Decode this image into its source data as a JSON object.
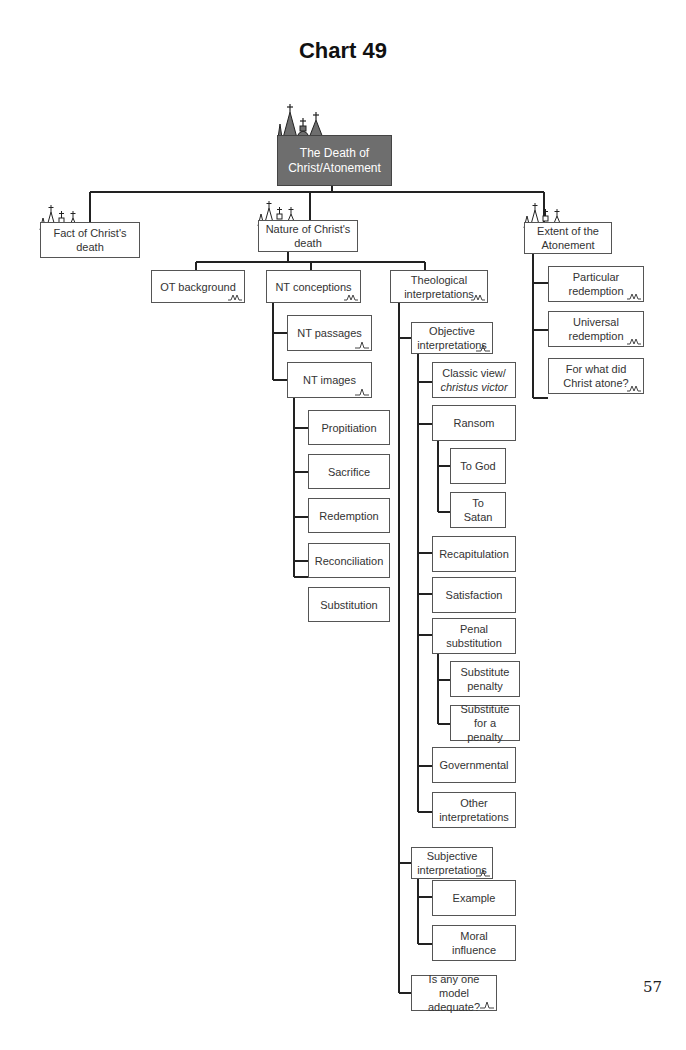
{
  "title": "Chart 49",
  "page_number": "57",
  "root": {
    "label": "The Death of Christ/Atonement",
    "icon": "church-skyline-icon"
  },
  "level1": [
    {
      "id": "fact",
      "label": "Fact of Christ's death"
    },
    {
      "id": "nature",
      "label": "Nature of Christ's death"
    },
    {
      "id": "extent",
      "label": "Extent of the Atonement"
    }
  ],
  "nature": {
    "children": [
      {
        "label": "OT background"
      },
      {
        "label": "NT conceptions"
      },
      {
        "label": "Theological interpretations"
      }
    ],
    "nt_conceptions": [
      {
        "label": "NT passages"
      },
      {
        "label": "NT images"
      }
    ],
    "nt_images": [
      {
        "label": "Propitiation"
      },
      {
        "label": "Sacrifice"
      },
      {
        "label": "Redemption"
      },
      {
        "label": "Reconciliation"
      },
      {
        "label": "Substitution"
      }
    ],
    "theological": [
      {
        "label": "Objective interpretations"
      },
      {
        "label": "Subjective interpretations"
      },
      {
        "label": "Is any one model adequate?"
      }
    ],
    "objective": [
      {
        "label": "Classic view/",
        "label_italic": "christus victor"
      },
      {
        "label": "Ransom"
      },
      {
        "label": "Recapitulation"
      },
      {
        "label": "Satisfaction"
      },
      {
        "label": "Penal substitution"
      },
      {
        "label": "Governmental"
      },
      {
        "label": "Other interpretations"
      }
    ],
    "ransom": [
      {
        "label": "To God"
      },
      {
        "label": "To Satan"
      }
    ],
    "penal": [
      {
        "label": "Substitute penalty"
      },
      {
        "label": "Substitute for a penalty"
      }
    ],
    "subjective": [
      {
        "label": "Example"
      },
      {
        "label": "Moral influence"
      }
    ]
  },
  "extent": {
    "children": [
      {
        "label": "Particular redemption"
      },
      {
        "label": "Universal redemption"
      },
      {
        "label": "For what did Christ atone?"
      }
    ]
  },
  "colors": {
    "root_fill": "#6e6e6e",
    "line": "#222222",
    "box_border": "#555555"
  }
}
